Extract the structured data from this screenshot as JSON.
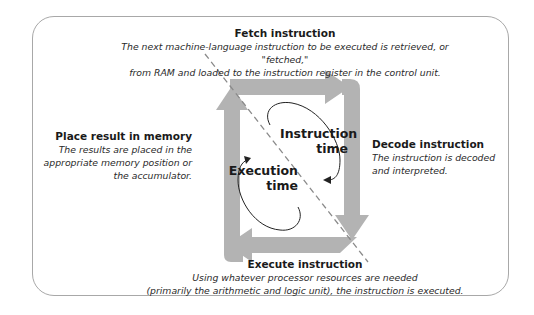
{
  "diagram": {
    "type": "machine-cycle",
    "colors": {
      "arrow_fill": "#b3b3b3",
      "arrow_light": "#c4c4c4",
      "frame_border": "#a8a8a8",
      "text": "#1a1a1a",
      "dashed_line": "#8a8a8a"
    },
    "steps": [
      {
        "id": "fetch",
        "title": "Fetch instruction",
        "description_lines": [
          "The next machine-language instruction to be executed is retrieved, or \"fetched,\"",
          "from RAM and loaded to the instruction register in the control unit."
        ]
      },
      {
        "id": "decode",
        "title": "Decode instruction",
        "description_lines": [
          "The instruction is decoded",
          "and interpreted."
        ]
      },
      {
        "id": "execute",
        "title": "Execute instruction",
        "description_lines": [
          "Using whatever processor resources are needed",
          "(primarily the arithmetic and logic unit), the instruction is executed."
        ]
      },
      {
        "id": "store",
        "title": "Place result in memory",
        "description_lines": [
          "The results are placed in the",
          "appropriate memory position or",
          "the accumulator."
        ]
      }
    ],
    "phases": [
      {
        "id": "instruction-time",
        "line1": "Instruction",
        "line2": "time"
      },
      {
        "id": "execution-time",
        "line1": "Execution",
        "line2": "time"
      }
    ]
  }
}
